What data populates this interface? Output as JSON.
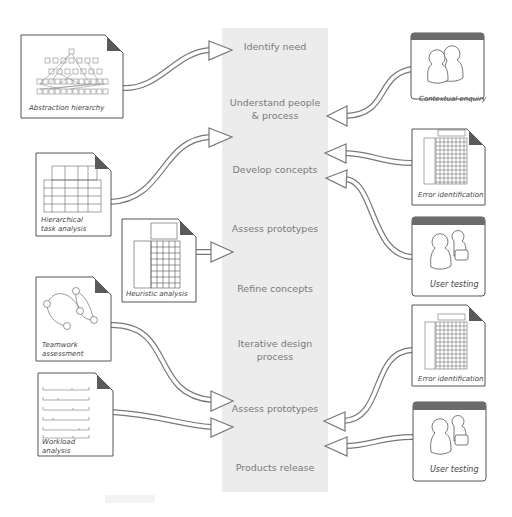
{
  "stages": [
    {
      "label": "Identify need"
    },
    {
      "label": "Understand people & process"
    },
    {
      "label": "Develop concepts"
    },
    {
      "label": "Assess prototypes"
    },
    {
      "label": "Refine concepts"
    },
    {
      "label": "Iterative design process"
    },
    {
      "label": "Assess prototypes"
    },
    {
      "label": "Products release"
    }
  ],
  "left_methods": [
    {
      "label": "Abstraction hierarchy",
      "targets": "Identify need"
    },
    {
      "label": "Hierarchical task analysis",
      "targets": "Develop concepts"
    },
    {
      "label": "Heuristic analysis",
      "targets": "Assess prototypes"
    },
    {
      "label": "Teamwork assessment",
      "targets": "Assess prototypes (2)"
    },
    {
      "label": "Workload analysis",
      "targets": "Assess prototypes (2)"
    }
  ],
  "right_methods": [
    {
      "label": "Contextual enquiry",
      "targets": "Understand people & process"
    },
    {
      "label": "Error identification",
      "targets": "Develop concepts"
    },
    {
      "label": "User testing",
      "targets": "Develop concepts"
    },
    {
      "label": "Error identification",
      "targets": "Assess prototypes (2)"
    },
    {
      "label": "User testing",
      "targets": "Assess prototypes (2)"
    }
  ],
  "colors": {
    "stage_column": "#ececec",
    "stage_text": "#7a7a7a",
    "doc_border": "#555555",
    "corner_fold": "#5a5a5a",
    "window_header": "#6b6b6b"
  }
}
